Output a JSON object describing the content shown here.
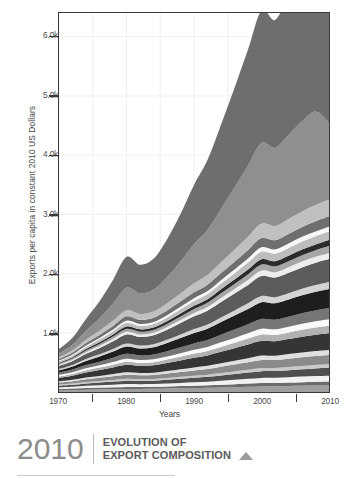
{
  "figure": {
    "background": "#ffffff"
  },
  "footer": {
    "year": "2010",
    "title_line1": "EVOLUTION OF",
    "title_line2": "EXPORT COMPOSITION",
    "triangle_icon": "triangle-up-icon",
    "accent_color": "#8c8c8c"
  },
  "chart_data": {
    "type": "area",
    "stacked": true,
    "title": "",
    "subtitle": "",
    "xlabel": "Years",
    "ylabel": "Exports per capita in constant 2010 US Dollars",
    "xlim": [
      1970,
      2010
    ],
    "ylim": [
      0,
      6400
    ],
    "grid": true,
    "grid_color": "#ececec",
    "legend": "none",
    "x_tick_labels": [
      "1970",
      "1980",
      "1990",
      "2000",
      "2010"
    ],
    "x_ticks": [
      1970,
      1980,
      1990,
      2000,
      2010
    ],
    "x_minor_ticks": [
      1975,
      1985,
      1995,
      2005
    ],
    "y_tick_labels": [
      "1.0k",
      "2.0k",
      "3.0k",
      "4.0k",
      "5.0k",
      "6.0k"
    ],
    "y_ticks": [
      1000,
      2000,
      3000,
      4000,
      5000,
      6000
    ],
    "x": [
      1970,
      1972,
      1974,
      1976,
      1978,
      1980,
      1982,
      1984,
      1986,
      1988,
      1990,
      1992,
      1994,
      1996,
      1998,
      2000,
      2002,
      2004,
      2006,
      2008,
      2010
    ],
    "series": [
      {
        "name": "Layer 01",
        "color": "#9e9e9e",
        "values": [
          30,
          34,
          40,
          44,
          48,
          52,
          52,
          54,
          58,
          62,
          66,
          70,
          76,
          82,
          88,
          94,
          96,
          100,
          104,
          108,
          110
        ]
      },
      {
        "name": "Layer 02",
        "color": "#6b6b6b",
        "values": [
          22,
          24,
          28,
          30,
          32,
          34,
          34,
          34,
          36,
          38,
          40,
          42,
          46,
          50,
          54,
          58,
          58,
          60,
          62,
          64,
          66
        ]
      },
      {
        "name": "Layer 03",
        "color": "#f2f2f2",
        "values": [
          26,
          30,
          36,
          40,
          44,
          48,
          46,
          46,
          50,
          54,
          58,
          62,
          68,
          74,
          80,
          86,
          86,
          90,
          94,
          98,
          100
        ]
      },
      {
        "name": "Layer 04",
        "color": "#4f4f4f",
        "values": [
          30,
          34,
          40,
          46,
          52,
          58,
          56,
          58,
          64,
          70,
          76,
          82,
          90,
          98,
          106,
          114,
          114,
          118,
          124,
          128,
          132
        ]
      },
      {
        "name": "Layer 05",
        "color": "#c9c9c9",
        "values": [
          18,
          20,
          24,
          26,
          28,
          30,
          28,
          28,
          30,
          32,
          34,
          36,
          40,
          44,
          48,
          52,
          52,
          54,
          56,
          58,
          60
        ]
      },
      {
        "name": "Layer 06",
        "color": "#8a8a8a",
        "values": [
          34,
          40,
          48,
          54,
          62,
          70,
          66,
          68,
          74,
          82,
          90,
          96,
          106,
          116,
          126,
          136,
          134,
          140,
          146,
          152,
          156
        ]
      },
      {
        "name": "Layer 07",
        "color": "#e0e0e0",
        "values": [
          20,
          24,
          28,
          32,
          36,
          40,
          38,
          38,
          42,
          46,
          50,
          54,
          58,
          64,
          70,
          76,
          74,
          78,
          82,
          84,
          86
        ]
      },
      {
        "name": "Layer 08",
        "color": "#353535",
        "values": [
          60,
          70,
          86,
          98,
          112,
          126,
          120,
          124,
          136,
          150,
          164,
          176,
          194,
          212,
          230,
          248,
          244,
          254,
          266,
          276,
          284
        ]
      },
      {
        "name": "Layer 09",
        "color": "#b2b2b2",
        "values": [
          26,
          30,
          36,
          42,
          48,
          54,
          52,
          54,
          58,
          64,
          70,
          76,
          84,
          92,
          100,
          108,
          106,
          110,
          116,
          120,
          124
        ]
      },
      {
        "name": "Layer 10",
        "color": "#fafafa",
        "values": [
          24,
          28,
          34,
          38,
          44,
          50,
          48,
          48,
          52,
          58,
          64,
          68,
          76,
          82,
          90,
          98,
          96,
          100,
          104,
          108,
          112
        ]
      },
      {
        "name": "Layer 11",
        "color": "#767676",
        "values": [
          36,
          44,
          54,
          62,
          72,
          82,
          78,
          80,
          88,
          98,
          108,
          116,
          128,
          140,
          152,
          164,
          162,
          168,
          176,
          182,
          188
        ]
      },
      {
        "name": "Layer 12",
        "color": "#1e1e1e",
        "values": [
          40,
          52,
          70,
          86,
          104,
          124,
          118,
          124,
          140,
          158,
          178,
          192,
          214,
          236,
          258,
          282,
          276,
          288,
          302,
          314,
          322
        ]
      },
      {
        "name": "Layer 13",
        "color": "#d4d4d4",
        "values": [
          22,
          26,
          32,
          38,
          44,
          50,
          48,
          50,
          54,
          60,
          66,
          72,
          80,
          88,
          96,
          104,
          102,
          106,
          110,
          114,
          118
        ]
      },
      {
        "name": "Layer 14",
        "color": "#5c5c5c",
        "values": [
          52,
          66,
          88,
          108,
          130,
          154,
          146,
          152,
          170,
          192,
          214,
          232,
          258,
          284,
          310,
          338,
          332,
          346,
          362,
          376,
          386
        ]
      },
      {
        "name": "Layer 15",
        "color": "#ededed",
        "values": [
          18,
          22,
          28,
          32,
          38,
          44,
          42,
          42,
          46,
          52,
          58,
          62,
          70,
          76,
          84,
          92,
          90,
          94,
          98,
          100,
          104
        ]
      },
      {
        "name": "Layer 16",
        "color": "#a6a6a6",
        "values": [
          20,
          24,
          30,
          36,
          42,
          48,
          46,
          48,
          52,
          58,
          64,
          70,
          78,
          86,
          94,
          102,
          100,
          104,
          108,
          112,
          116
        ]
      },
      {
        "name": "Layer 17",
        "color": "#2b2b2b",
        "values": [
          16,
          20,
          26,
          30,
          36,
          42,
          40,
          40,
          44,
          50,
          56,
          60,
          68,
          74,
          82,
          90,
          88,
          92,
          96,
          98,
          102
        ]
      },
      {
        "name": "Layer 18",
        "color": "#bdbdbd",
        "values": [
          22,
          28,
          36,
          44,
          52,
          62,
          58,
          60,
          66,
          74,
          82,
          88,
          98,
          108,
          118,
          128,
          126,
          130,
          136,
          140,
          144
        ]
      },
      {
        "name": "Layer 19",
        "color": "#f7f7f7",
        "values": [
          14,
          18,
          22,
          26,
          30,
          36,
          34,
          34,
          38,
          42,
          46,
          50,
          56,
          62,
          68,
          74,
          72,
          76,
          78,
          80,
          82
        ]
      },
      {
        "name": "Layer 20",
        "color": "#6f6f6f",
        "values": [
          26,
          32,
          42,
          52,
          62,
          74,
          70,
          72,
          80,
          90,
          100,
          108,
          120,
          132,
          144,
          156,
          154,
          160,
          166,
          172,
          176
        ]
      },
      {
        "name": "Layer 21",
        "color": "#c0c0c0",
        "values": [
          30,
          40,
          56,
          70,
          86,
          104,
          98,
          104,
          118,
          134,
          152,
          164,
          184,
          204,
          224,
          246,
          240,
          252,
          264,
          274,
          282
        ]
      },
      {
        "name": "Layer 22",
        "color": "#8f8f8f",
        "values": [
          60,
          90,
          150,
          210,
          290,
          380,
          350,
          370,
          440,
          540,
          660,
          760,
          900,
          1050,
          1200,
          1360,
          1320,
          1420,
          1520,
          1580,
          1300
        ]
      },
      {
        "name": "Layer 23",
        "color": "#6e6e6e",
        "values": [
          80,
          120,
          200,
          290,
          400,
          520,
          480,
          520,
          640,
          800,
          1000,
          1180,
          1420,
          1680,
          1960,
          2240,
          2160,
          2360,
          2560,
          2680,
          2080
        ]
      }
    ]
  }
}
